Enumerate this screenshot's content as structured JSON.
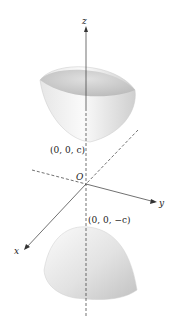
{
  "diagram": {
    "axes": {
      "z_label": "z",
      "y_label": "y",
      "x_label": "x",
      "origin_label": "O"
    },
    "points": {
      "upper_vertex": "(0, 0, c)",
      "lower_vertex": "(0, 0, −c)"
    },
    "colors": {
      "surface_light": "#f4f4f4",
      "surface_dark": "#c8c8c8",
      "axis": "#333333"
    }
  }
}
